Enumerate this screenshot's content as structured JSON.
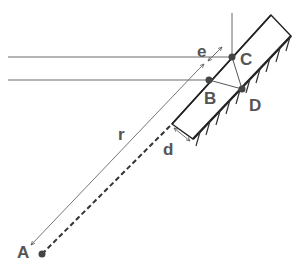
{
  "diagram": {
    "labels": {
      "A": "A",
      "B": "B",
      "C": "C",
      "D": "D",
      "r": "r",
      "e": "e",
      "d": "d"
    },
    "points": {
      "A": {
        "x": 42,
        "y": 254
      },
      "B": {
        "x": 209,
        "y": 80
      },
      "C": {
        "x": 232,
        "y": 57
      },
      "D": {
        "x": 242,
        "y": 89
      }
    },
    "colors": {
      "line": "#6a6a6a",
      "thick": "#222222",
      "label": "#555555",
      "point": "#333333"
    }
  }
}
